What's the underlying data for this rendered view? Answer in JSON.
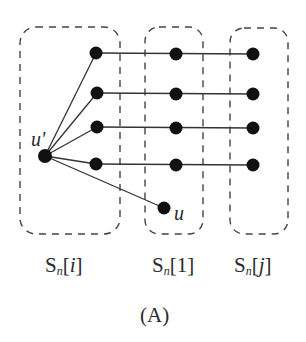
{
  "diagram": {
    "caption": "(A)",
    "groups": [
      {
        "id": "Sn_i",
        "base": "S",
        "sub": "n",
        "index": "i",
        "index_italic": true
      },
      {
        "id": "Sn_1",
        "base": "S",
        "sub": "n",
        "index": "1",
        "index_italic": false
      },
      {
        "id": "Sn_j",
        "base": "S",
        "sub": "n",
        "index": "j",
        "index_italic": true
      }
    ],
    "node_labels": {
      "u_prime": "u'",
      "u": "u"
    },
    "colors": {
      "node": "#111111",
      "edge": "#333333",
      "box_dash": "#444444"
    }
  }
}
